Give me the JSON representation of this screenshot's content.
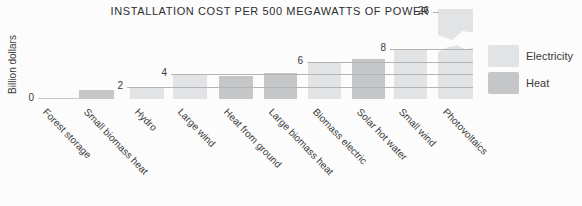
{
  "figure": {
    "title": "INSTALLATION COST PER 500 MEGAWATTS OF POWER",
    "y_axis_label": "Billion dollars"
  },
  "legend": {
    "items": [
      {
        "label": "Electricity",
        "color": "#e2e3e4"
      },
      {
        "label": "Heat",
        "color": "#c5c6c8"
      }
    ]
  },
  "colors": {
    "background": "#fcfcfc",
    "electricity": "#e2e3e4",
    "heat": "#c5c6c8",
    "gridline": "#b3b4b6",
    "text": "#3a3a3a"
  },
  "chart_data": {
    "type": "bar",
    "title": "INSTALLATION COST PER 500 MEGAWATTS OF POWER",
    "ylabel": "Billion dollars",
    "xlabel": "",
    "legend_position": "right",
    "legend_entries": [
      "Electricity",
      "Heat"
    ],
    "grid": "stepped reference lines starting at labeled bars, extending right",
    "yticks": [
      0,
      2,
      4,
      6,
      8,
      26
    ],
    "ylim": [
      0,
      9
    ],
    "axis_break": {
      "category": "Photovoltaics",
      "hidden_range": [
        9,
        25
      ],
      "top_value": 26
    },
    "categories": [
      "Forest storage",
      "Small biomass heat",
      "Hydro",
      "Large wind",
      "Heat from ground",
      "Large biomass heat",
      "Biomass electric",
      "Solar hot water",
      "Small wind",
      "Photovoltaics"
    ],
    "bars": [
      {
        "category": "Forest storage",
        "group": "Heat",
        "value": 0.1
      },
      {
        "category": "Small biomass heat",
        "group": "Heat",
        "value": 1.5
      },
      {
        "category": "Hydro",
        "group": "Electricity",
        "value": 2
      },
      {
        "category": "Large wind",
        "group": "Electricity",
        "value": 4
      },
      {
        "category": "Heat from ground",
        "group": "Heat",
        "value": 3.7
      },
      {
        "category": "Large biomass heat",
        "group": "Heat",
        "value": 4.2
      },
      {
        "category": "Biomass electric",
        "group": "Electricity",
        "value": 6
      },
      {
        "category": "Solar hot water",
        "group": "Heat",
        "value": 6.5
      },
      {
        "category": "Small wind",
        "group": "Electricity",
        "value": 8
      },
      {
        "category": "Photovoltaics",
        "group": "Electricity",
        "value": 26
      }
    ],
    "value_labels": [
      {
        "value": 0,
        "at_category": "Forest storage"
      },
      {
        "value": 2,
        "at_category": "Hydro"
      },
      {
        "value": 4,
        "at_category": "Large wind"
      },
      {
        "value": 6,
        "at_category": "Biomass electric"
      },
      {
        "value": 8,
        "at_category": "Small wind"
      },
      {
        "value": 26,
        "at_category": "Photovoltaics"
      }
    ]
  }
}
